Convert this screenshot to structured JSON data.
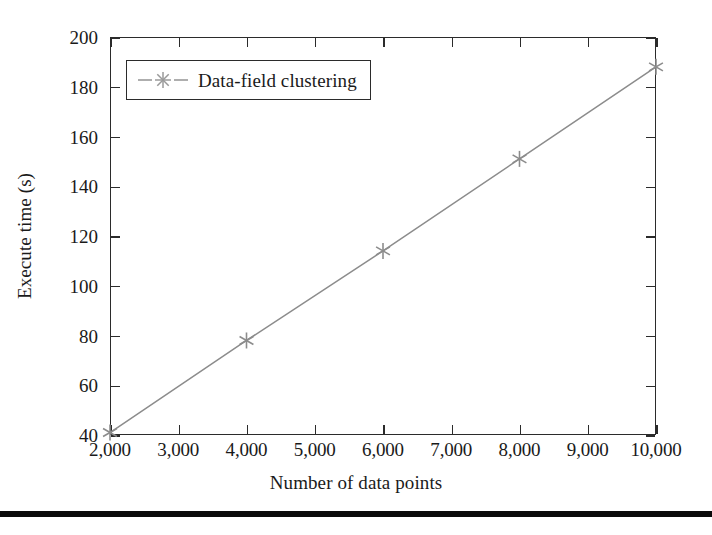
{
  "chart_data": {
    "type": "line",
    "title": "",
    "subtitle": "",
    "xlabel": "Number of data points",
    "ylabel": "Execute time (s)",
    "xlim": [
      2000,
      10000
    ],
    "ylim": [
      40,
      200
    ],
    "xticks": [
      2000,
      3000,
      4000,
      5000,
      6000,
      7000,
      8000,
      9000,
      10000
    ],
    "yticks": [
      40,
      60,
      80,
      100,
      120,
      140,
      160,
      180,
      200
    ],
    "xticklabels": [
      "2,000",
      "3,000",
      "4,000",
      "5,000",
      "6,000",
      "7,000",
      "8,000",
      "9,000",
      "10,000"
    ],
    "yticklabels": [
      "40",
      "60",
      "80",
      "100",
      "120",
      "140",
      "160",
      "180",
      "200"
    ],
    "grid": false,
    "legend_position": "upper left",
    "series": [
      {
        "name": "Data-field clustering",
        "color": "#8c8c8c",
        "marker": "asterisk",
        "linestyle": "solid",
        "x": [
          2000,
          4000,
          6000,
          8000,
          10000
        ],
        "values": [
          41,
          78,
          114,
          151,
          188
        ]
      }
    ]
  },
  "legend": {
    "entries": [
      {
        "label": "Data-field clustering",
        "marker": "asterisk-marker",
        "color": "#8c8c8c"
      }
    ]
  },
  "axes": {
    "x_title": "Number of data points",
    "y_title": "Execute time (s)"
  },
  "colors": {
    "series": "#8c8c8c",
    "frame": "#2b2b2b",
    "text": "#1a1a1a",
    "rule": "#0b0b0b",
    "background": "#ffffff"
  }
}
